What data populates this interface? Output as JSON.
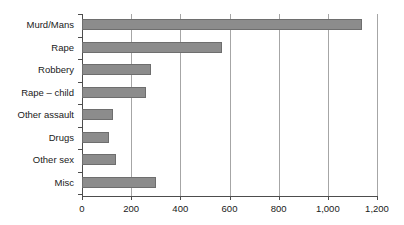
{
  "chart_data": {
    "type": "bar",
    "orientation": "horizontal",
    "title": "",
    "subtitle": "",
    "xlabel": "",
    "ylabel": "",
    "categories": [
      "Murd/Mans",
      "Rape",
      "Robbery",
      "Rape – child",
      "Other assault",
      "Drugs",
      "Other sex",
      "Misc"
    ],
    "values": [
      1140,
      570,
      280,
      260,
      125,
      110,
      140,
      300
    ],
    "xlim": [
      0,
      1200
    ],
    "xticks": [
      0,
      200,
      400,
      600,
      800,
      1000,
      1200
    ],
    "xtick_labels": [
      "0",
      "200",
      "400",
      "600",
      "800",
      "1,000",
      "1,200"
    ],
    "grid": "vertical",
    "legend": "none",
    "bar_color": "#8c8c8c",
    "bar_edge_color": "#6e6e6e",
    "axis_color": "#4d4d4d",
    "gridline_color": "#a6a6a6",
    "background_color": "#ffffff"
  }
}
